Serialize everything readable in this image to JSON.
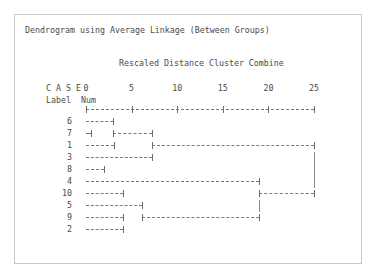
{
  "window": {
    "background": "#ffffff",
    "panel_border_color": "#c8c8c8"
  },
  "header": {
    "title": "Dendrogram using Average Linkage (Between Groups)",
    "subtitle": "Rescaled Distance Cluster Combine"
  },
  "axis": {
    "case_label": "C A S E",
    "label_col": "Label",
    "num_col": "Num",
    "ticks": [
      0,
      5,
      10,
      15,
      20,
      25
    ],
    "tick_labels": [
      "0",
      "5",
      "10",
      "15",
      "20",
      "25"
    ],
    "range_min": 0,
    "range_max": 25,
    "ink_color": "#6e6e6e",
    "text_color": "#4a4a4a"
  },
  "chart_data": {
    "type": "dendrogram",
    "title": "Dendrogram using Average Linkage (Between Groups)",
    "subtitle": "Rescaled Distance Cluster Combine",
    "xlabel": "Rescaled Distance Cluster Combine",
    "ylabel": "CASE Label Num",
    "xlim": [
      0,
      25
    ],
    "xticks": [
      0,
      5,
      10,
      15,
      20,
      25
    ],
    "grid": false,
    "legend": "none",
    "leaf_order": [
      6,
      7,
      1,
      3,
      8,
      4,
      10,
      5,
      9,
      2
    ],
    "leaf_labels": [
      "6",
      "7",
      "1",
      "3",
      "8",
      "4",
      "10",
      "5",
      "9",
      "2"
    ],
    "rows": [
      {
        "num": "6",
        "segments": [
          {
            "from": 0,
            "to": 3.0
          }
        ],
        "vbars": []
      },
      {
        "num": "7",
        "segments": [
          {
            "from": 0,
            "to": 0.6
          },
          {
            "from": 3.0,
            "to": 7.2
          }
        ],
        "vbars": []
      },
      {
        "num": "1",
        "segments": [
          {
            "from": 0,
            "to": 3.1
          },
          {
            "from": 7.2,
            "to": 25.0
          }
        ],
        "vbars": []
      },
      {
        "num": "3",
        "segments": [
          {
            "from": 0,
            "to": 7.2
          }
        ],
        "vbars": [
          25.0
        ]
      },
      {
        "num": "8",
        "segments": [
          {
            "from": 0,
            "to": 2.0
          }
        ],
        "vbars": [
          25.0
        ]
      },
      {
        "num": "4",
        "segments": [
          {
            "from": 0,
            "to": 19.0
          }
        ],
        "vbars": [
          25.0
        ]
      },
      {
        "num": "10",
        "segments": [
          {
            "from": 0,
            "to": 4.1
          },
          {
            "from": 19.0,
            "to": 25.0
          }
        ],
        "vbars": []
      },
      {
        "num": "5",
        "segments": [
          {
            "from": 0,
            "to": 6.1
          }
        ],
        "vbars": [
          19.0
        ]
      },
      {
        "num": "9",
        "segments": [
          {
            "from": 0,
            "to": 4.1
          },
          {
            "from": 6.1,
            "to": 19.0
          }
        ],
        "vbars": []
      },
      {
        "num": "2",
        "segments": [
          {
            "from": 0,
            "to": 4.1
          }
        ],
        "vbars": []
      }
    ],
    "merge_distances": [
      0.6,
      2.0,
      3.0,
      3.1,
      4.1,
      6.1,
      7.2,
      19.0,
      25.0
    ]
  }
}
